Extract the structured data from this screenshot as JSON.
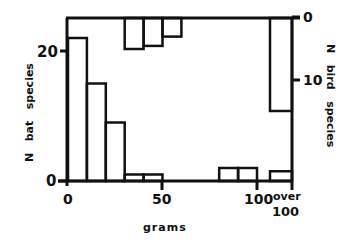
{
  "chart_data": {
    "type": "bar",
    "title": "",
    "xlabel": "grams",
    "x_tick_labels": [
      "0",
      "50",
      "100",
      "over 100"
    ],
    "bins": [
      "0-10",
      "10-20",
      "20-30",
      "30-40",
      "40-50",
      "50-60",
      "60-70",
      "70-80",
      "80-90",
      "90-100",
      "over 100"
    ],
    "series": [
      {
        "name": "N bat species",
        "axis": "left",
        "direction": "up",
        "ylabel": "N   bat   species",
        "ylim": [
          0,
          25
        ],
        "yticks": [
          "0",
          "20"
        ],
        "values": [
          22,
          15,
          9,
          1,
          1,
          0,
          0,
          0,
          2,
          2,
          1.5
        ]
      },
      {
        "name": "N bird species",
        "axis": "right",
        "direction": "down",
        "ylabel": "N   bird   species",
        "ylim": [
          0,
          26
        ],
        "yticks": [
          "0",
          "10"
        ],
        "values": [
          0,
          0,
          0,
          5,
          4.5,
          3,
          0,
          0,
          0,
          0,
          15
        ]
      }
    ],
    "grid": false,
    "legend": "none"
  },
  "labels": {
    "left_axis": "N   bat   species",
    "right_axis": "N   bird   species",
    "x_axis": "grams",
    "tick_0": "0",
    "tick_50": "50",
    "tick_100": "100",
    "tick_over": "over",
    "tick_over_100": "100",
    "left_tick_0": "0",
    "left_tick_20": "20",
    "right_tick_0": "0",
    "right_tick_10": "10"
  }
}
